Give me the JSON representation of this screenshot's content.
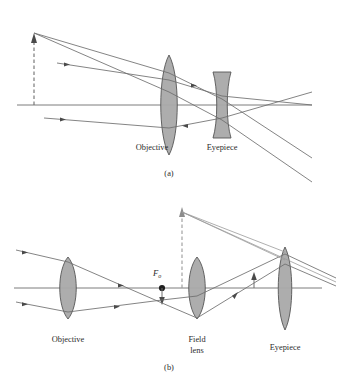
{
  "figure": {
    "background_color": "#ffffff",
    "ink_color": "#4a4a4a",
    "label_color": "#2b2b2b",
    "lens_fill_color": "#a9a9a9",
    "lens_stroke_color": "#555555",
    "dashed_color": "#8c8c8c"
  },
  "panels": [
    {
      "id": "a",
      "caption": "(a)",
      "type": "galilean-telescope",
      "labels": {
        "objective": "Objective",
        "eyepiece": "Eyepiece"
      },
      "elements": {
        "object_arrow": "dashed-up-arrow",
        "objective_lens": "biconvex",
        "eyepiece_lens": "biconcave",
        "optical_axis": "horizontal-line"
      }
    },
    {
      "id": "b",
      "caption": "(b)",
      "type": "keplerian-telescope-with-field-lens",
      "labels": {
        "objective": "Objective",
        "field_lens_line1": "Field",
        "field_lens_line2": "lens",
        "eyepiece": "Eyepiece",
        "focal_point": "F",
        "focal_point_subscript": "o"
      },
      "elements": {
        "objective_lens": "biconvex",
        "field_lens": "biconvex",
        "eyepiece_lens": "biconvex-tall",
        "focal_point_marker": "filled-dot",
        "image_arrow_down": "small-down-arrow",
        "image_arrow_up": "small-up-arrow",
        "virtual_image_arrow": "dashed-up-arrow",
        "optical_axis": "horizontal-line"
      }
    }
  ]
}
